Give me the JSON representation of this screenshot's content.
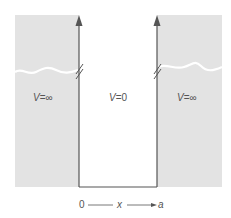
{
  "diagram": {
    "regions": [
      {
        "id": "left",
        "label_var": "V",
        "label_eq": "=∞"
      },
      {
        "id": "center",
        "label_var": "V",
        "label_eq": "=0"
      },
      {
        "id": "right",
        "label_var": "V",
        "label_eq": "=∞"
      }
    ],
    "axis": {
      "start": "0",
      "variable": "x",
      "end": "a"
    },
    "colors": {
      "wall_fill": "#e3e3e3",
      "line": "#555555",
      "wave": "#ffffff"
    }
  }
}
